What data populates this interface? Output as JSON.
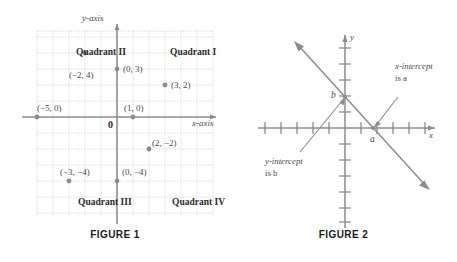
{
  "figure1": {
    "caption": "FIGURE 1",
    "axis_labels": {
      "x": "x-axis",
      "y": "y-axis"
    },
    "origin_label": "0",
    "quadrants": [
      {
        "name": "Quadrant II",
        "x": 76,
        "y": 48
      },
      {
        "name": "Quadrant I",
        "x": 170,
        "y": 48
      },
      {
        "name": "Quadrant III",
        "x": 78,
        "y": 198
      },
      {
        "name": "Quadrant IV",
        "x": 172,
        "y": 198
      }
    ],
    "points": [
      {
        "label": "(−2, 4)",
        "x": -2,
        "y": 4,
        "lx": 69,
        "ly": 71
      },
      {
        "label": "(0, 3)",
        "x": 0,
        "y": 3,
        "lx": 123,
        "ly": 73
      },
      {
        "label": "(3, 2)",
        "x": 3,
        "y": 2,
        "lx": 173,
        "ly": 89
      },
      {
        "label": "(−5, 0)",
        "x": -5,
        "y": 0,
        "lx": 38,
        "ly": 110
      },
      {
        "label": "(1, 0)",
        "x": 1,
        "y": 0,
        "lx": 124,
        "ly": 108
      },
      {
        "label": "(2, −2)",
        "x": 2,
        "y": -2,
        "lx": 152,
        "ly": 145
      },
      {
        "label": "(−3, −4)",
        "x": -3,
        "y": -4,
        "lx": 60,
        "ly": 177
      },
      {
        "label": "(0, −4)",
        "x": 0,
        "y": -4,
        "lx": 122,
        "ly": 177
      }
    ],
    "grid": {
      "x_min": -5,
      "x_max": 6,
      "y_min": -5,
      "y_max": 5,
      "unit_px": 16
    }
  },
  "figure2": {
    "caption": "FIGURE 2",
    "axis_labels": {
      "x": "x",
      "y": "y"
    },
    "intercepts": {
      "x_label": "a",
      "y_label": "b",
      "x_note_line1": "x-intercept",
      "x_note_line2": "is a",
      "y_note_line1": "y-intercept",
      "y_note_line2": "is b"
    },
    "line": {
      "type": "descending",
      "arrowheads": "both"
    }
  },
  "colors": {
    "axis": "#8c8c8c",
    "grid": "#c9c9c9",
    "point": "#8c8c8c",
    "line": "#8c8c8c",
    "text": "#4a4a4a",
    "caption": "#1a1a1a"
  }
}
